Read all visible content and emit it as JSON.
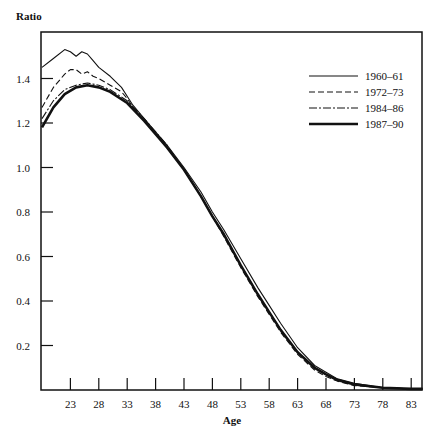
{
  "chart_data": {
    "type": "line",
    "title": "",
    "xlabel": "Age",
    "ylabel": "Ratio",
    "xlim": [
      18,
      85
    ],
    "ylim": [
      0,
      1.6
    ],
    "grid": false,
    "legend_position": "upper right (inside plot)",
    "x_ticks": [
      23,
      28,
      33,
      38,
      43,
      48,
      53,
      58,
      63,
      68,
      73,
      78,
      83
    ],
    "x_tick_labels": [
      "23",
      "28",
      "33",
      "38",
      "43",
      "48",
      "53",
      "58",
      "63",
      "68",
      "73",
      "78",
      "83"
    ],
    "y_ticks": [
      0.2,
      0.4,
      0.6,
      0.8,
      1.0,
      1.2,
      1.4
    ],
    "y_tick_labels": [
      "0.2",
      "0.4",
      "0.6",
      "0.8",
      "1.0",
      "1.2",
      "1.4"
    ],
    "series": [
      {
        "name": "1960–61",
        "style": "solid-thin",
        "x": [
          18,
          20,
          22,
          23,
          24,
          25,
          26,
          27,
          28,
          30,
          32,
          33,
          34,
          36,
          38,
          40,
          43,
          46,
          48,
          50,
          53,
          56,
          58,
          60,
          63,
          66,
          68,
          70,
          73,
          78,
          83,
          85
        ],
        "values": [
          1.45,
          1.49,
          1.53,
          1.52,
          1.5,
          1.52,
          1.51,
          1.48,
          1.45,
          1.41,
          1.36,
          1.32,
          1.28,
          1.22,
          1.16,
          1.1,
          1.0,
          0.89,
          0.8,
          0.72,
          0.59,
          0.46,
          0.38,
          0.3,
          0.19,
          0.11,
          0.08,
          0.05,
          0.03,
          0.01,
          0.005,
          0.005
        ]
      },
      {
        "name": "1972–73",
        "style": "dashed",
        "x": [
          18,
          20,
          22,
          23,
          24,
          25,
          26,
          27,
          28,
          30,
          32,
          33,
          34,
          36,
          38,
          40,
          43,
          46,
          48,
          50,
          53,
          56,
          58,
          60,
          63,
          66,
          68,
          70,
          73,
          78,
          83,
          85
        ],
        "values": [
          1.27,
          1.36,
          1.42,
          1.44,
          1.44,
          1.42,
          1.43,
          1.41,
          1.4,
          1.37,
          1.34,
          1.31,
          1.27,
          1.21,
          1.15,
          1.09,
          0.99,
          0.87,
          0.78,
          0.69,
          0.55,
          0.42,
          0.34,
          0.26,
          0.16,
          0.09,
          0.06,
          0.04,
          0.02,
          0.01,
          0.005,
          0.005
        ]
      },
      {
        "name": "1984–86",
        "style": "dash-dot",
        "x": [
          18,
          20,
          22,
          24,
          26,
          28,
          30,
          33,
          36,
          38,
          40,
          43,
          46,
          48,
          50,
          53,
          56,
          58,
          60,
          63,
          66,
          68,
          70,
          73,
          78,
          83,
          85
        ],
        "values": [
          1.22,
          1.3,
          1.35,
          1.37,
          1.38,
          1.37,
          1.35,
          1.3,
          1.22,
          1.16,
          1.1,
          0.99,
          0.87,
          0.78,
          0.7,
          0.56,
          0.43,
          0.35,
          0.27,
          0.17,
          0.1,
          0.07,
          0.045,
          0.025,
          0.01,
          0.005,
          0.005
        ]
      },
      {
        "name": "1987–90",
        "style": "solid-bold",
        "x": [
          18,
          20,
          22,
          24,
          26,
          28,
          30,
          33,
          36,
          38,
          40,
          43,
          46,
          48,
          50,
          53,
          56,
          58,
          60,
          63,
          66,
          68,
          70,
          73,
          78,
          83,
          85
        ],
        "values": [
          1.18,
          1.27,
          1.33,
          1.36,
          1.37,
          1.36,
          1.34,
          1.29,
          1.21,
          1.15,
          1.09,
          0.99,
          0.87,
          0.78,
          0.7,
          0.56,
          0.43,
          0.35,
          0.27,
          0.17,
          0.1,
          0.07,
          0.045,
          0.025,
          0.01,
          0.005,
          0.005
        ]
      }
    ]
  },
  "axes": {
    "ylabel": "Ratio",
    "xlabel": "Age"
  },
  "legend": [
    {
      "label": "1960–61",
      "style": "solid-thin"
    },
    {
      "label": "1972–73",
      "style": "dashed"
    },
    {
      "label": "1984–86",
      "style": "dash-dot"
    },
    {
      "label": "1987–90",
      "style": "solid-bold"
    }
  ],
  "colors": {
    "ink": "#111111",
    "background": "#ffffff"
  }
}
